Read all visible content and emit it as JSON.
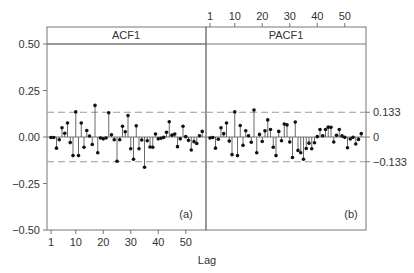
{
  "chart_data": [
    {
      "type": "bar",
      "subtype": "stem",
      "title": "ACF1",
      "panel_tag": "(a)",
      "xlabel": "Lag",
      "ylabel": "",
      "xticks": [
        1,
        10,
        20,
        30,
        40,
        50
      ],
      "yticks": [
        0.5,
        0.25,
        0.0,
        -0.25,
        -0.5
      ],
      "ytick_labels": [
        "0.50",
        "0.25",
        "0.00",
        "−0.25",
        "−0.50"
      ],
      "ylim": [
        -0.5,
        0.5
      ],
      "xlim": [
        0,
        57
      ],
      "confidence_band": [
        -0.133,
        0.133
      ],
      "x": [
        1,
        2,
        3,
        4,
        5,
        6,
        7,
        8,
        9,
        10,
        11,
        12,
        13,
        14,
        15,
        16,
        17,
        18,
        19,
        20,
        21,
        22,
        23,
        24,
        25,
        26,
        27,
        28,
        29,
        30,
        31,
        32,
        33,
        34,
        35,
        36,
        37,
        38,
        39,
        40,
        41,
        42,
        43,
        44,
        45,
        46,
        47,
        48,
        49,
        50,
        51,
        52,
        53,
        54,
        55,
        56
      ],
      "values": [
        -0.003,
        -0.003,
        -0.06,
        -0.015,
        0.05,
        0.02,
        0.075,
        -0.03,
        -0.1,
        0.135,
        -0.1,
        0.075,
        -0.055,
        0.035,
        0.005,
        -0.04,
        0.17,
        -0.085,
        -0.005,
        -0.01,
        -0.005,
        0.13,
        0.012,
        -0.015,
        -0.13,
        -0.015,
        0.058,
        0.028,
        0.115,
        -0.063,
        -0.12,
        0.06,
        -0.063,
        -0.016,
        -0.163,
        -0.02,
        -0.054,
        -0.055,
        0.016,
        -0.01,
        -0.007,
        -0.002,
        0.025,
        0.082,
        0.01,
        0.016,
        -0.052,
        -0.01,
        0.058,
        0.002,
        -0.018,
        -0.07,
        -0.025,
        -0.035,
        0.007,
        0.03
      ]
    },
    {
      "type": "bar",
      "subtype": "stem",
      "title": "PACF1",
      "panel_tag": "(b)",
      "xlabel": "Lag",
      "ylabel": "",
      "xticks": [
        1,
        10,
        20,
        30,
        40,
        50
      ],
      "xticks_position": "top",
      "yticks": [
        0.133,
        0,
        -0.133
      ],
      "ytick_labels": [
        "0.133",
        "0",
        "−0.133"
      ],
      "yticks_position": "right",
      "ylim": [
        -0.5,
        0.5
      ],
      "xlim": [
        0,
        57
      ],
      "confidence_band": [
        -0.133,
        0.133
      ],
      "x": [
        1,
        2,
        3,
        4,
        5,
        6,
        7,
        8,
        9,
        10,
        11,
        12,
        13,
        14,
        15,
        16,
        17,
        18,
        19,
        20,
        21,
        22,
        23,
        24,
        25,
        26,
        27,
        28,
        29,
        30,
        31,
        32,
        33,
        34,
        35,
        36,
        37,
        38,
        39,
        40,
        41,
        42,
        43,
        44,
        45,
        46,
        47,
        48,
        49,
        50,
        51,
        52,
        53,
        54,
        55,
        56
      ],
      "values": [
        -0.005,
        -0.003,
        -0.06,
        -0.012,
        0.05,
        0.018,
        0.075,
        -0.022,
        -0.095,
        0.135,
        -0.1,
        0.062,
        -0.045,
        0.034,
        0.007,
        -0.028,
        0.145,
        -0.085,
        0.014,
        -0.024,
        0.033,
        0.092,
        0.04,
        -0.055,
        -0.1,
        0.03,
        -0.02,
        0.07,
        0.065,
        -0.027,
        -0.11,
        0.08,
        -0.072,
        -0.085,
        -0.12,
        -0.062,
        -0.033,
        -0.063,
        -0.031,
        0.002,
        0.04,
        0.007,
        0.04,
        0.053,
        0.052,
        -0.027,
        0.009,
        0.04,
        0.006,
        -0.002,
        -0.058,
        -0.011,
        -0.002,
        -0.038,
        -0.013,
        0.018
      ]
    }
  ],
  "labels": {
    "acf_title": "ACF1",
    "pacf_title": "PACF1",
    "panel_a": "(a)",
    "panel_b": "(b)",
    "xlabel": "Lag"
  }
}
